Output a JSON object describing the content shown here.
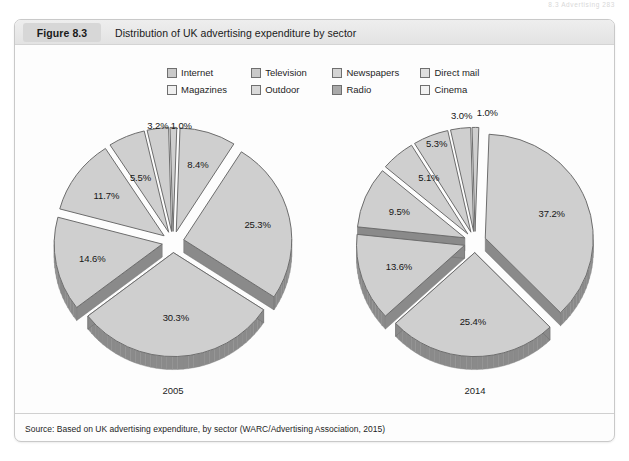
{
  "runhead": "8.3  Advertising  283",
  "figure": {
    "number": "Figure 8.3",
    "title": "Distribution of UK advertising expenditure by sector",
    "source": "Source: Based on UK advertising expenditure, by sector (WARC/Advertising Association, 2015)"
  },
  "legend": {
    "rows": [
      [
        {
          "label": "Internet",
          "color": "#c9c9c9"
        },
        {
          "label": "Television",
          "color": "#c9c9c9"
        },
        {
          "label": "Newspapers",
          "color": "#d4d4d4"
        },
        {
          "label": "Direct mail",
          "color": "#dedede"
        }
      ],
      [
        {
          "label": "Magazines",
          "color": "#efefef"
        },
        {
          "label": "Outdoor",
          "color": "#d9d9d9"
        },
        {
          "label": "Radio",
          "color": "#a9a9a9"
        },
        {
          "label": "Cinema",
          "color": "#f2f2f2"
        }
      ]
    ]
  },
  "chart_data": [
    {
      "type": "pie",
      "title": "2005",
      "exploded": true,
      "categories": [
        "Internet",
        "Television",
        "Newspapers",
        "Direct mail",
        "Magazines",
        "Outdoor",
        "Radio",
        "Cinema"
      ],
      "values": [
        8.4,
        25.3,
        30.3,
        14.6,
        11.7,
        5.5,
        3.2,
        1.0
      ],
      "labels": [
        "8.4%",
        "25.3%",
        "30.3%",
        "14.6%",
        "11.7%",
        "5.5%",
        "3.2%",
        "1.0%"
      ],
      "unit": "%"
    },
    {
      "type": "pie",
      "title": "2014",
      "exploded": true,
      "categories": [
        "Internet",
        "Television",
        "Newspapers",
        "Direct mail",
        "Magazines",
        "Outdoor",
        "Radio",
        "Cinema"
      ],
      "values": [
        37.2,
        25.4,
        13.6,
        9.5,
        5.1,
        5.3,
        3.0,
        1.0
      ],
      "labels": [
        "37.2%",
        "25.4%",
        "13.6%",
        "9.5%",
        "5.1%",
        "5.3%",
        "3.0%",
        "1.0%"
      ],
      "unit": "%"
    }
  ],
  "style": {
    "slice_fill": "#cfcfcf",
    "slice_edge": "#6d6d6d",
    "slice_depth": "#8a8a8a",
    "card_bg": "#fdfdfd",
    "header_bg": "#e8e8e8"
  }
}
